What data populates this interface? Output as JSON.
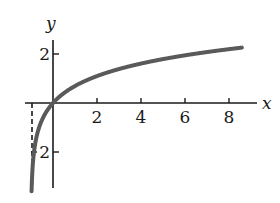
{
  "chart_data": {
    "type": "line",
    "title": "",
    "function_hint": "y = ln(x + 1)",
    "xlabel": "x",
    "ylabel": "y",
    "xlim": [
      -1.2,
      9
    ],
    "ylim": [
      -3.5,
      2.6
    ],
    "x_ticks": [
      2,
      4,
      6,
      8
    ],
    "x_tick_labels": [
      "2",
      "4",
      "6",
      "8"
    ],
    "y_ticks": [
      2,
      -2
    ],
    "y_tick_labels": [
      "2",
      "2"
    ],
    "asymptote": {
      "x": -1,
      "style": "dashed"
    },
    "grid": false,
    "legend": null,
    "series": [
      {
        "name": "curve",
        "color": "#5a5a5a",
        "x": [
          -0.97,
          -0.9,
          -0.8,
          -0.6,
          -0.4,
          -0.2,
          0,
          0.5,
          1,
          2,
          3,
          4,
          5,
          6,
          7,
          8
        ],
        "y": [
          -3.5,
          -2.3,
          -1.61,
          -0.92,
          -0.51,
          -0.22,
          0,
          0.41,
          0.69,
          1.1,
          1.39,
          1.61,
          1.79,
          1.95,
          2.08,
          2.2
        ]
      }
    ]
  },
  "axes": {
    "x_label": "x",
    "y_label": "y"
  },
  "colors": {
    "axis": "#1a1a1a",
    "curve": "#5a5a5a",
    "asymptote": "#1a1a1a"
  }
}
